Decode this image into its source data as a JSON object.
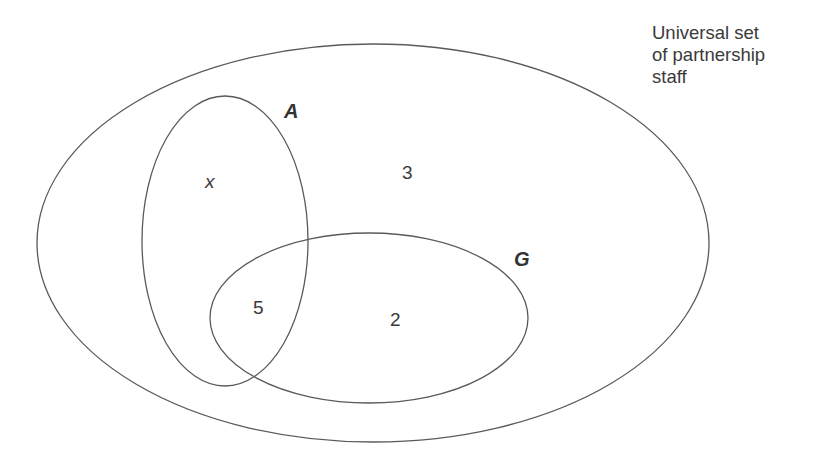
{
  "diagram": {
    "type": "venn",
    "universal_set_label": [
      "Universal set",
      "of partnership",
      "staff"
    ],
    "sets": [
      {
        "name": "A",
        "label": "A"
      },
      {
        "name": "G",
        "label": "G"
      }
    ],
    "regions": {
      "A_only": "x",
      "A_and_G": "5",
      "G_only": "2",
      "neither": "3"
    },
    "colors": {
      "stroke": "#5a5a5a",
      "text": "#3a3a3a",
      "background": "#ffffff"
    }
  }
}
